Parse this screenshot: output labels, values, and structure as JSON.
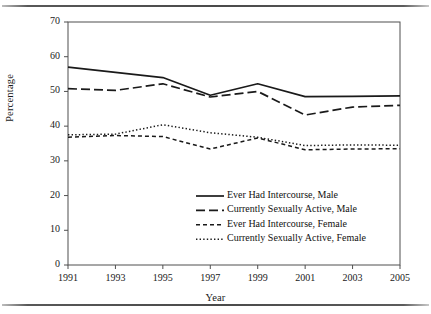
{
  "chart_data": {
    "type": "line",
    "title": "",
    "subtitle": "",
    "xlabel": "Year",
    "ylabel": "Percentage",
    "x": [
      1991,
      1993,
      1995,
      1997,
      1999,
      2001,
      2003,
      2005
    ],
    "xtick_labels": [
      "1991",
      "1993",
      "1995",
      "1997",
      "1999",
      "2001",
      "2003",
      "2005"
    ],
    "ytick_labels": [
      "0",
      "10",
      "20",
      "30",
      "40",
      "50",
      "60",
      "70"
    ],
    "ytick_values": [
      0,
      10,
      20,
      30,
      40,
      50,
      60,
      70
    ],
    "xlim": [
      1991,
      2005
    ],
    "ylim": [
      0,
      70
    ],
    "grid": false,
    "legend_position": "lower right",
    "series": [
      {
        "name": "Ever Had Intercourse, Male",
        "style": "solid",
        "color": "#1a1a1a",
        "values": [
          57.0,
          55.5,
          54.0,
          48.9,
          52.2,
          48.5,
          48.6,
          48.7
        ]
      },
      {
        "name": "Currently Sexually Active, Male",
        "style": "long-dash",
        "color": "#1a1a1a",
        "values": [
          50.8,
          50.3,
          52.2,
          48.4,
          50.0,
          43.2,
          45.5,
          46.0
        ]
      },
      {
        "name": "Ever Had Intercourse, Female",
        "style": "short-dash",
        "color": "#1a1a1a",
        "values": [
          36.8,
          37.3,
          37.0,
          33.4,
          36.6,
          33.2,
          33.4,
          33.5
        ]
      },
      {
        "name": "Currently Sexually Active, Female",
        "style": "dotted",
        "color": "#1a1a1a",
        "values": [
          37.5,
          37.7,
          40.4,
          38.1,
          36.8,
          34.4,
          34.6,
          34.5
        ]
      }
    ]
  },
  "legend": {
    "items": [
      {
        "label": "Ever Had Intercourse, Male"
      },
      {
        "label": "Currently Sexually Active, Male"
      },
      {
        "label": "Ever Had Intercourse, Female"
      },
      {
        "label": "Currently Sexually Active, Female"
      }
    ]
  }
}
